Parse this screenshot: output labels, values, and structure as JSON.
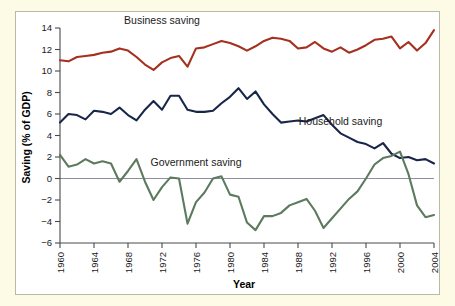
{
  "figure": {
    "background_color": "#fdfbe6",
    "panel_color": "#ffffff",
    "border_color": "#b9b9a8"
  },
  "chart_data": {
    "type": "line",
    "title": "",
    "xlabel": "Year",
    "ylabel": "Saving (% of GDP)",
    "xlim": [
      1960,
      2004
    ],
    "ylim": [
      -6,
      14
    ],
    "ytick_step": 2,
    "xtick_step": 4,
    "yticks": [
      "14",
      "12",
      "10",
      "8",
      "6",
      "4",
      "2",
      "0",
      "-2",
      "-4",
      "-6"
    ],
    "xticks": [
      "1960",
      "1964",
      "1968",
      "1972",
      "1976",
      "1980",
      "1984",
      "1988",
      "1992",
      "1996",
      "2000",
      "2004"
    ],
    "grid": false,
    "zero_reference_line": true,
    "zero_line_color": "#8e8e9e",
    "legend_position": "inline-annotations",
    "x": [
      1960,
      1961,
      1962,
      1963,
      1964,
      1965,
      1966,
      1967,
      1968,
      1969,
      1970,
      1971,
      1972,
      1973,
      1974,
      1975,
      1976,
      1977,
      1978,
      1979,
      1980,
      1981,
      1982,
      1983,
      1984,
      1985,
      1986,
      1987,
      1988,
      1989,
      1990,
      1991,
      1992,
      1993,
      1994,
      1995,
      1996,
      1997,
      1998,
      1999,
      2000,
      2001,
      2002,
      2003,
      2004
    ],
    "series": [
      {
        "name": "Business saving",
        "color": "#a5301f",
        "label": "Business saving",
        "values": [
          11.0,
          10.9,
          11.3,
          11.4,
          11.5,
          11.7,
          11.8,
          12.1,
          11.9,
          11.3,
          10.6,
          10.1,
          10.8,
          11.2,
          11.4,
          10.4,
          12.1,
          12.2,
          12.5,
          12.8,
          12.6,
          12.3,
          11.9,
          12.3,
          12.8,
          13.1,
          13.0,
          12.8,
          12.1,
          12.2,
          12.7,
          12.1,
          11.8,
          12.2,
          11.7,
          12.0,
          12.4,
          12.9,
          13.0,
          13.2,
          12.1,
          12.7,
          11.9,
          12.6,
          13.8
        ]
      },
      {
        "name": "Household saving",
        "color": "#18264a",
        "label": "Household saving",
        "values": [
          5.2,
          6.0,
          5.9,
          5.5,
          6.3,
          6.2,
          6.0,
          6.6,
          5.9,
          5.4,
          6.4,
          7.2,
          6.4,
          7.7,
          7.7,
          6.4,
          6.2,
          6.2,
          6.3,
          7.0,
          7.6,
          8.4,
          7.4,
          8.1,
          6.9,
          6.0,
          5.2,
          5.3,
          5.4,
          5.3,
          5.6,
          5.9,
          5.0,
          4.2,
          3.8,
          3.4,
          3.2,
          2.8,
          3.3,
          2.3,
          1.9,
          2.0,
          1.7,
          1.8,
          1.4
        ]
      },
      {
        "name": "Government saving",
        "color": "#5c7a5e",
        "label": "Government saving",
        "values": [
          2.2,
          1.1,
          1.3,
          1.8,
          1.4,
          1.6,
          1.4,
          -0.3,
          0.7,
          1.8,
          -0.3,
          -2.0,
          -0.8,
          0.1,
          0.0,
          -4.2,
          -2.2,
          -1.3,
          0.0,
          0.2,
          -1.5,
          -1.7,
          -4.1,
          -4.8,
          -3.5,
          -3.5,
          -3.2,
          -2.5,
          -2.2,
          -1.9,
          -3.0,
          -4.6,
          -3.7,
          -2.8,
          -1.9,
          -1.2,
          0.0,
          1.3,
          1.9,
          2.1,
          2.5,
          0.4,
          -2.5,
          -3.6,
          -3.4
        ]
      }
    ],
    "annotations": [
      {
        "text": "Business saving",
        "x": 1972,
        "y": 14.4
      },
      {
        "text": "Household saving",
        "x": 1993,
        "y": 5.0
      },
      {
        "text": "Government saving",
        "x": 1976,
        "y": 1.2
      }
    ]
  }
}
